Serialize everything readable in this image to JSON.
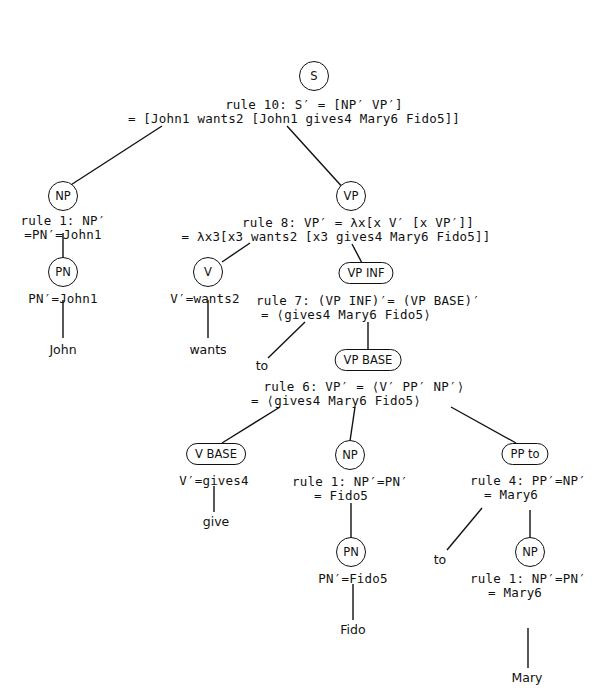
{
  "figure": {
    "type": "semantic parse tree",
    "nodes": {
      "s": {
        "label": "S",
        "rule_line1": "rule 10: S′ = [NP′ VP′]",
        "rule_line2": "= [John1 wants2 [John1 gives4 Mary6 Fido5]]"
      },
      "np1": {
        "label": "NP",
        "rule_line1": "rule 1: NP′",
        "rule_line2": "=PN′=John1"
      },
      "pn1": {
        "label": "PN",
        "value": "PN′=John1",
        "word": "John"
      },
      "vp": {
        "label": "VP",
        "rule_line1": "rule 8: VP′ = λx[x V′ [x VP′]]",
        "rule_line2": "= λx3[x3 wants2 [x3 gives4 Mary6 Fido5]]"
      },
      "v": {
        "label": "V",
        "value": "V′=wants2",
        "word": "wants"
      },
      "vpinf": {
        "label": "VP INF",
        "rule_line1": "rule 7: (VP INF)′= (VP BASE)′",
        "rule_line2": "= ⟨gives4 Mary6 Fido5⟩",
        "word": "to"
      },
      "vpbase": {
        "label": "VP BASE",
        "rule_line1": "rule 6: VP′ = ⟨V′ PP′ NP′⟩",
        "rule_line2": "= ⟨gives4 Mary6 Fido5⟩"
      },
      "vbase": {
        "label": "V BASE",
        "value": "V′=gives4",
        "word": "give"
      },
      "np2": {
        "label": "NP",
        "rule_line1": "rule 1: NP′=PN′",
        "rule_line2": "= Fido5"
      },
      "pn2": {
        "label": "PN",
        "value": "PN′=Fido5",
        "word": "Fido"
      },
      "ppto": {
        "label": "PP to",
        "rule_line1": "rule 4: PP′=NP′",
        "rule_line2": "= Mary6",
        "word": "to"
      },
      "np3": {
        "label": "NP",
        "rule_line1": "rule 1: NP′=PN′",
        "rule_line2": "= Mary6",
        "word": "Mary"
      }
    }
  }
}
